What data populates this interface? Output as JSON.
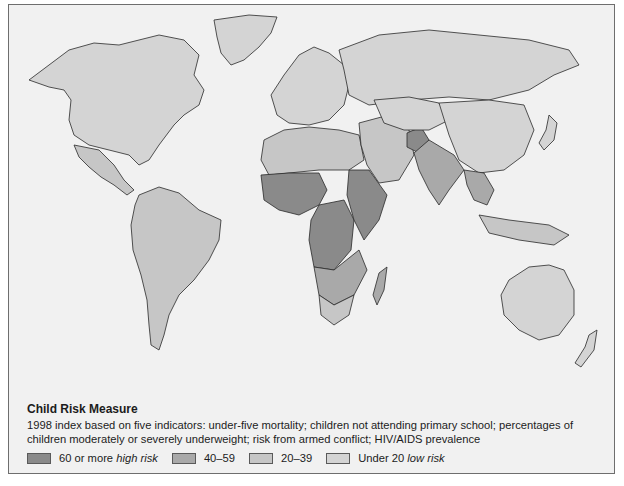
{
  "map": {
    "title": "Child Risk Measure",
    "description": "1998 index based on five indicators: under-five mortality; children not attending primary school; percentages of children moderately or severely underweight; risk from armed conflict; HIV/AIDS prevalence",
    "colors": {
      "background": "#f1f1f1",
      "high": "#8a8a8a",
      "mid": "#a9a9a9",
      "low_mid": "#c6c6c6",
      "low": "#d4d4d4",
      "ocean": "#f1f1f1",
      "border": "#2a2a2a"
    },
    "legend": [
      {
        "range": "60 or more",
        "qualifier": "high risk",
        "class": "high"
      },
      {
        "range": "40–59",
        "qualifier": "",
        "class": "mid"
      },
      {
        "range": "20–39",
        "qualifier": "",
        "class": "low_mid"
      },
      {
        "range": "Under 20",
        "qualifier": "low risk",
        "class": "low"
      }
    ],
    "regions": [
      {
        "name": "north-america",
        "class": "low"
      },
      {
        "name": "greenland",
        "class": "low"
      },
      {
        "name": "central-america",
        "class": "low_mid"
      },
      {
        "name": "south-america",
        "class": "low_mid"
      },
      {
        "name": "europe",
        "class": "low"
      },
      {
        "name": "russia",
        "class": "low"
      },
      {
        "name": "north-africa",
        "class": "low_mid"
      },
      {
        "name": "west-africa",
        "class": "high"
      },
      {
        "name": "central-africa",
        "class": "high"
      },
      {
        "name": "east-africa",
        "class": "high"
      },
      {
        "name": "southern-africa",
        "class": "mid"
      },
      {
        "name": "south-africa",
        "class": "low_mid"
      },
      {
        "name": "madagascar",
        "class": "mid"
      },
      {
        "name": "middle-east",
        "class": "low_mid"
      },
      {
        "name": "afghanistan",
        "class": "high"
      },
      {
        "name": "south-asia",
        "class": "mid"
      },
      {
        "name": "china",
        "class": "low"
      },
      {
        "name": "central-asia",
        "class": "low"
      },
      {
        "name": "southeast-asia",
        "class": "mid"
      },
      {
        "name": "indonesia",
        "class": "low_mid"
      },
      {
        "name": "japan",
        "class": "low"
      },
      {
        "name": "australia",
        "class": "low"
      },
      {
        "name": "new-zealand",
        "class": "low"
      }
    ]
  }
}
